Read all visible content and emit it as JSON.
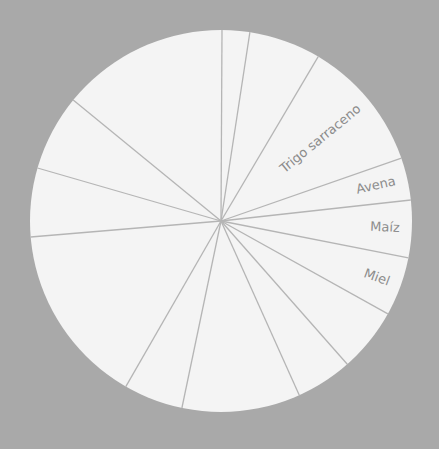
{
  "chart_data": {
    "type": "pie",
    "title": "",
    "center": [
      221,
      221
    ],
    "radius": 191,
    "start_angle_deg": 0.3,
    "colors": {
      "background": "#a9a9a9",
      "slice_fill": "#f4f4f4",
      "divider": "#b5b5b5",
      "label": "#8c8c8c"
    },
    "slices": [
      {
        "label": "",
        "angle": 8.4
      },
      {
        "label": "",
        "angle": 21.9
      },
      {
        "label": "Trigo sarraceno",
        "angle": 40.2
      },
      {
        "label": "Avena",
        "angle": 12.9
      },
      {
        "label": "Maíz",
        "angle": 17.4
      },
      {
        "label": "Miel",
        "angle": 18.0
      },
      {
        "label": "",
        "angle": 19.5
      },
      {
        "label": "",
        "angle": 17.2
      },
      {
        "label": "",
        "angle": 36.0
      },
      {
        "label": "",
        "angle": 18.1
      },
      {
        "label": "",
        "angle": 55.3
      },
      {
        "label": "",
        "angle": 20.9
      },
      {
        "label": "",
        "angle": 23.2
      },
      {
        "label": "",
        "angle": 51.0
      }
    ],
    "categories": [
      "",
      "",
      "Trigo sarraceno",
      "Avena",
      "Maíz",
      "Miel",
      "",
      "",
      "",
      "",
      "",
      "",
      "",
      ""
    ],
    "values": [
      8.4,
      21.9,
      40.2,
      12.9,
      17.4,
      18.0,
      19.5,
      17.2,
      36.0,
      18.1,
      55.3,
      20.9,
      23.2,
      51.0
    ],
    "value_unit": "degrees (estimated from slice geometry)",
    "legend": "none",
    "grid": false
  }
}
